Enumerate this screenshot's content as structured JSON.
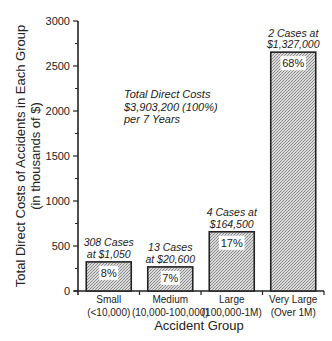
{
  "chart_data": {
    "type": "bar",
    "title": "",
    "xlabel": "Accident Group",
    "ylabel": "Total Direct Costs of Accidents in Each Group",
    "ylabel_sub": "(in thousands of $)",
    "ylim": [
      0,
      3000
    ],
    "yticks": [
      "0",
      "500",
      "1000",
      "1500",
      "2000",
      "2500",
      "3000"
    ],
    "categories": [
      "Small (<10,000)",
      "Medium (10,000-100,000)",
      "Large (100,000-1M)",
      "Very Large (Over 1M)"
    ],
    "category_lines": [
      [
        "Small",
        "(<10,000)"
      ],
      [
        "Medium",
        "(10,000-100,000)"
      ],
      [
        "Large",
        "(100,000-1M)"
      ],
      [
        "Very Large",
        "(Over 1M)"
      ]
    ],
    "values": [
      323.4,
      267.8,
      658,
      2654
    ],
    "percent_labels": [
      "8%",
      "7%",
      "17%",
      "68%"
    ],
    "annotations": [
      [
        "308 Cases",
        "at $1,050"
      ],
      [
        "13 Cases",
        "at $20,600"
      ],
      [
        "4 Cases at",
        "$164,500"
      ],
      [
        "2 Cases at",
        "$1,327,000"
      ]
    ],
    "note": [
      "Total Direct Costs",
      "$3,903,200 (100%)",
      "per 7 Years"
    ],
    "grid": false,
    "legend": null
  }
}
